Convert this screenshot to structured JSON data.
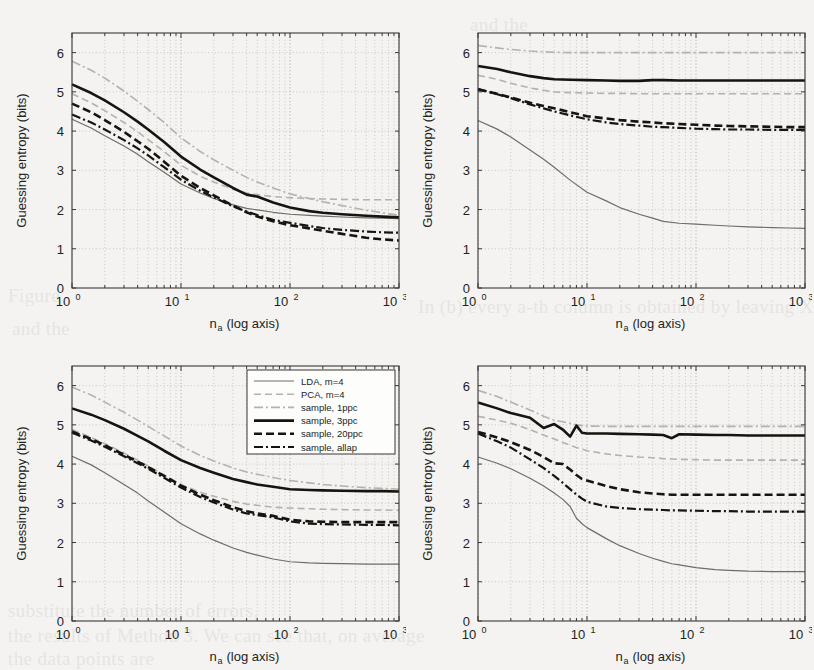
{
  "figure": {
    "background_color": "#f4f3f1",
    "panel_count": 4,
    "axis_color": "#3a3735",
    "grid_color": "#b9b5b1"
  },
  "axes": {
    "xlabel_main": "n",
    "xlabel_sub": "a",
    "xlabel_tail": "(log axis)",
    "ylabel": "Guessing entropy (bits)",
    "xticks": [
      "10",
      "10",
      "10",
      "10"
    ],
    "xtick_exponents": [
      "0",
      "1",
      "2",
      "3"
    ],
    "yticks": [
      "0",
      "1",
      "2",
      "3",
      "4",
      "5",
      "6"
    ],
    "xlim_log": [
      0,
      3
    ],
    "ylim": [
      0,
      6.5
    ]
  },
  "legend": {
    "visible_in_panel": 3,
    "entries": [
      {
        "label": "LDA, m=4",
        "color": "#6f6c6a",
        "width": 1.2,
        "dash": "none",
        "style": "solid"
      },
      {
        "label": "PCA, m=4",
        "color": "#b4b1ae",
        "width": 1.6,
        "dash": "7,4",
        "style": "dashed"
      },
      {
        "label": "sample, 1ppc",
        "color": "#b4b1ae",
        "width": 1.6,
        "dash": "9,3,2,3",
        "style": "dashdot"
      },
      {
        "label": "sample, 3ppc",
        "color": "#17140f",
        "width": 2.6,
        "dash": "none",
        "style": "solid"
      },
      {
        "label": "sample, 20ppc",
        "color": "#17140f",
        "width": 2.6,
        "dash": "8,4",
        "style": "dashed"
      },
      {
        "label": "sample, allap",
        "color": "#17140f",
        "width": 2.2,
        "dash": "9,3,2,3",
        "style": "dashdot"
      }
    ]
  },
  "chart_data": [
    {
      "type": "line",
      "panel": "top-left",
      "title": "",
      "xlabel": "n_a (log axis)",
      "ylabel": "Guessing entropy (bits)",
      "xscale": "log",
      "xlim": [
        1,
        1000
      ],
      "ylim": [
        0,
        6.5
      ],
      "grid": true,
      "legend_position": "none",
      "x": [
        1,
        1.5,
        2,
        3,
        4,
        5,
        7,
        10,
        15,
        20,
        30,
        40,
        50,
        70,
        100,
        150,
        200,
        300,
        500,
        700,
        1000
      ],
      "series": [
        {
          "name": "LDA, m=4",
          "values": [
            4.3,
            4.08,
            3.88,
            3.62,
            3.41,
            3.22,
            2.95,
            2.65,
            2.42,
            2.28,
            2.12,
            2.03,
            1.99,
            1.93,
            1.88,
            1.85,
            1.83,
            1.81,
            1.79,
            1.78,
            1.77
          ]
        },
        {
          "name": "PCA, m=4",
          "values": [
            4.95,
            4.72,
            4.52,
            4.22,
            3.98,
            3.78,
            3.48,
            3.13,
            2.85,
            2.7,
            2.52,
            2.42,
            2.38,
            2.33,
            2.3,
            2.28,
            2.27,
            2.26,
            2.25,
            2.25,
            2.25
          ]
        },
        {
          "name": "sample, 1ppc",
          "values": [
            5.78,
            5.55,
            5.35,
            5.02,
            4.76,
            4.55,
            4.22,
            3.83,
            3.48,
            3.27,
            3.0,
            2.82,
            2.7,
            2.55,
            2.4,
            2.28,
            2.2,
            2.1,
            1.98,
            1.92,
            1.85
          ]
        },
        {
          "name": "sample, 3ppc",
          "values": [
            5.19,
            4.97,
            4.78,
            4.48,
            4.24,
            4.04,
            3.72,
            3.35,
            3.02,
            2.82,
            2.55,
            2.38,
            2.33,
            2.18,
            2.05,
            1.96,
            1.92,
            1.88,
            1.84,
            1.82,
            1.8
          ]
        },
        {
          "name": "sample, 20ppc",
          "values": [
            4.7,
            4.48,
            4.28,
            3.98,
            3.74,
            3.55,
            3.22,
            2.86,
            2.55,
            2.36,
            2.1,
            1.93,
            1.82,
            1.7,
            1.6,
            1.52,
            1.46,
            1.38,
            1.28,
            1.24,
            1.21
          ]
        },
        {
          "name": "sample, allap",
          "values": [
            4.42,
            4.22,
            4.04,
            3.77,
            3.56,
            3.38,
            3.08,
            2.76,
            2.48,
            2.31,
            2.08,
            1.95,
            1.86,
            1.74,
            1.66,
            1.58,
            1.53,
            1.48,
            1.44,
            1.42,
            1.41
          ]
        }
      ]
    },
    {
      "type": "line",
      "panel": "top-right",
      "title": "",
      "xlabel": "n_a (log axis)",
      "ylabel": "Guessing entropy (bits)",
      "xscale": "log",
      "xlim": [
        1,
        1000
      ],
      "ylim": [
        0,
        6.5
      ],
      "grid": true,
      "legend_position": "none",
      "x": [
        1,
        1.5,
        2,
        3,
        4,
        5,
        7,
        10,
        15,
        20,
        30,
        40,
        50,
        70,
        100,
        150,
        200,
        300,
        500,
        700,
        1000
      ],
      "series": [
        {
          "name": "LDA, m=4",
          "values": [
            4.27,
            4.05,
            3.85,
            3.52,
            3.28,
            3.08,
            2.75,
            2.44,
            2.22,
            2.05,
            1.88,
            1.78,
            1.7,
            1.65,
            1.63,
            1.6,
            1.58,
            1.56,
            1.54,
            1.53,
            1.52
          ]
        },
        {
          "name": "PCA, m=4",
          "values": [
            5.42,
            5.32,
            5.22,
            5.1,
            5.04,
            5.0,
            4.98,
            4.97,
            4.96,
            4.96,
            4.95,
            4.95,
            4.95,
            4.95,
            4.95,
            4.95,
            4.95,
            4.95,
            4.95,
            4.95,
            4.95
          ]
        },
        {
          "name": "sample, 1ppc",
          "values": [
            6.18,
            6.12,
            6.08,
            6.04,
            6.02,
            6.01,
            6.0,
            6.0,
            6.0,
            6.0,
            6.0,
            6.0,
            6.0,
            6.0,
            6.0,
            6.0,
            6.0,
            6.0,
            6.0,
            6.0,
            6.0
          ]
        },
        {
          "name": "sample, 3ppc",
          "values": [
            5.66,
            5.58,
            5.5,
            5.4,
            5.35,
            5.32,
            5.31,
            5.3,
            5.29,
            5.28,
            5.28,
            5.3,
            5.3,
            5.29,
            5.29,
            5.29,
            5.29,
            5.29,
            5.29,
            5.29,
            5.29
          ]
        },
        {
          "name": "sample, 20ppc",
          "values": [
            5.06,
            4.95,
            4.86,
            4.72,
            4.64,
            4.58,
            4.48,
            4.38,
            4.32,
            4.28,
            4.24,
            4.22,
            4.2,
            4.18,
            4.16,
            4.14,
            4.13,
            4.12,
            4.11,
            4.1,
            4.1
          ]
        },
        {
          "name": "sample, allap",
          "values": [
            5.08,
            4.94,
            4.84,
            4.68,
            4.58,
            4.5,
            4.4,
            4.3,
            4.22,
            4.18,
            4.14,
            4.11,
            4.1,
            4.08,
            4.06,
            4.05,
            4.04,
            4.04,
            4.03,
            4.03,
            4.03
          ]
        }
      ]
    },
    {
      "type": "line",
      "panel": "bottom-left",
      "title": "",
      "xlabel": "n_a (log axis)",
      "ylabel": "Guessing entropy (bits)",
      "xscale": "log",
      "xlim": [
        1,
        1000
      ],
      "ylim": [
        0,
        6.5
      ],
      "grid": true,
      "legend_position": "upper right",
      "x": [
        1,
        1.5,
        2,
        3,
        4,
        5,
        7,
        10,
        15,
        20,
        30,
        40,
        50,
        70,
        100,
        150,
        200,
        300,
        500,
        700,
        1000
      ],
      "series": [
        {
          "name": "LDA, m=4",
          "values": [
            4.2,
            3.98,
            3.78,
            3.48,
            3.26,
            3.06,
            2.78,
            2.48,
            2.22,
            2.06,
            1.86,
            1.75,
            1.68,
            1.58,
            1.51,
            1.48,
            1.47,
            1.46,
            1.45,
            1.45,
            1.45
          ]
        },
        {
          "name": "PCA, m=4",
          "values": [
            4.88,
            4.68,
            4.52,
            4.28,
            4.1,
            3.95,
            3.72,
            3.48,
            3.28,
            3.18,
            3.05,
            2.98,
            2.95,
            2.9,
            2.88,
            2.86,
            2.85,
            2.84,
            2.83,
            2.83,
            2.82
          ]
        },
        {
          "name": "sample, 1ppc",
          "values": [
            5.96,
            5.76,
            5.58,
            5.32,
            5.12,
            4.96,
            4.72,
            4.46,
            4.22,
            4.08,
            3.9,
            3.8,
            3.74,
            3.66,
            3.58,
            3.52,
            3.48,
            3.44,
            3.4,
            3.38,
            3.36
          ]
        },
        {
          "name": "sample, 3ppc",
          "values": [
            5.42,
            5.26,
            5.12,
            4.9,
            4.72,
            4.58,
            4.34,
            4.1,
            3.9,
            3.78,
            3.62,
            3.54,
            3.48,
            3.42,
            3.36,
            3.34,
            3.33,
            3.32,
            3.31,
            3.31,
            3.3
          ]
        },
        {
          "name": "sample, 20ppc",
          "values": [
            4.83,
            4.64,
            4.48,
            4.24,
            4.06,
            3.92,
            3.7,
            3.45,
            3.22,
            3.08,
            2.9,
            2.8,
            2.74,
            2.68,
            2.58,
            2.54,
            2.53,
            2.52,
            2.52,
            2.52,
            2.52
          ]
        },
        {
          "name": "sample, allap",
          "values": [
            4.8,
            4.6,
            4.44,
            4.2,
            4.02,
            3.88,
            3.65,
            3.4,
            3.16,
            3.02,
            2.84,
            2.74,
            2.7,
            2.64,
            2.54,
            2.48,
            2.47,
            2.46,
            2.45,
            2.45,
            2.44
          ]
        }
      ]
    },
    {
      "type": "line",
      "panel": "bottom-right",
      "title": "",
      "xlabel": "n_a (log axis)",
      "ylabel": "Guessing entropy (bits)",
      "xscale": "log",
      "xlim": [
        1,
        1000
      ],
      "ylim": [
        0,
        6.5
      ],
      "grid": true,
      "legend_position": "none",
      "x": [
        1,
        1.5,
        2,
        3,
        4,
        5,
        6,
        7,
        8,
        9,
        10,
        15,
        20,
        30,
        40,
        50,
        60,
        70,
        100,
        150,
        200,
        300,
        500,
        700,
        1000
      ],
      "series": [
        {
          "name": "LDA, m=4",
          "values": [
            4.18,
            4.02,
            3.88,
            3.64,
            3.44,
            3.26,
            3.1,
            2.92,
            2.62,
            2.48,
            2.38,
            2.1,
            1.92,
            1.72,
            1.6,
            1.52,
            1.46,
            1.43,
            1.36,
            1.31,
            1.29,
            1.27,
            1.26,
            1.26,
            1.26
          ]
        },
        {
          "name": "PCA, m=4",
          "values": [
            5.22,
            5.12,
            5.04,
            4.88,
            4.74,
            4.64,
            4.55,
            4.48,
            4.42,
            4.38,
            4.34,
            4.26,
            4.22,
            4.18,
            4.16,
            4.14,
            4.13,
            4.12,
            4.11,
            4.1,
            4.1,
            4.1,
            4.1,
            4.1,
            4.1
          ]
        },
        {
          "name": "sample, 1ppc",
          "values": [
            5.88,
            5.72,
            5.58,
            5.38,
            5.22,
            5.12,
            5.08,
            5.04,
            5.0,
            4.98,
            4.97,
            4.96,
            4.96,
            4.96,
            4.96,
            4.96,
            4.96,
            4.96,
            4.96,
            4.96,
            4.96,
            4.96,
            4.96,
            4.96,
            4.96
          ]
        },
        {
          "name": "sample, 3ppc",
          "values": [
            5.57,
            5.42,
            5.3,
            5.18,
            4.92,
            5.02,
            4.88,
            4.7,
            4.98,
            4.8,
            4.78,
            4.78,
            4.77,
            4.76,
            4.75,
            4.74,
            4.66,
            4.76,
            4.75,
            4.74,
            4.74,
            4.73,
            4.73,
            4.73,
            4.73
          ]
        },
        {
          "name": "sample, 20ppc",
          "values": [
            4.82,
            4.68,
            4.56,
            4.36,
            4.18,
            4.02,
            4.0,
            3.86,
            3.72,
            3.62,
            3.58,
            3.44,
            3.36,
            3.28,
            3.25,
            3.23,
            3.22,
            3.22,
            3.22,
            3.22,
            3.22,
            3.22,
            3.22,
            3.22,
            3.22
          ]
        },
        {
          "name": "sample, allap",
          "values": [
            4.78,
            4.58,
            4.42,
            4.12,
            3.9,
            3.7,
            3.52,
            3.36,
            3.22,
            3.12,
            3.04,
            2.92,
            2.88,
            2.85,
            2.84,
            2.83,
            2.82,
            2.82,
            2.81,
            2.8,
            2.8,
            2.79,
            2.79,
            2.79,
            2.79
          ]
        }
      ]
    }
  ],
  "background_text": [
    {
      "text": "and the",
      "x": 470,
      "y": 14
    },
    {
      "text": "Figure",
      "x": 8,
      "y": 285
    },
    {
      "text": "In (b) every  a-th column is obtained by leaving X",
      "x": 418,
      "y": 296
    },
    {
      "text": "and the",
      "x": 12,
      "y": 318
    },
    {
      "text": "the results of Method 3. We can see that, on average",
      "x": 8,
      "y": 625
    },
    {
      "text": "substitute the number of errors,",
      "x": 8,
      "y": 600
    },
    {
      "text": "the data points are",
      "x": 8,
      "y": 648
    }
  ]
}
